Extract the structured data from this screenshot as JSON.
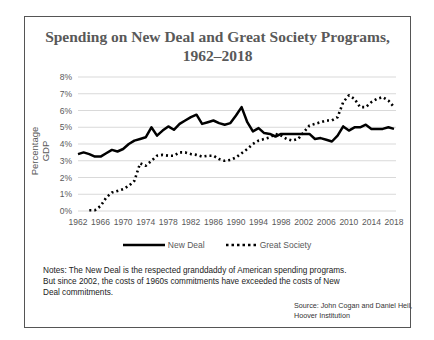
{
  "chart_data": {
    "type": "line",
    "title": "Spending on New Deal and Great Society Programs, 1962–2018",
    "title_line1": "Spending on New Deal and Great Society Programs,",
    "title_line2": "1962–2018",
    "xlabel": "",
    "ylabel": "Percentage GDP",
    "ylim": [
      0,
      8
    ],
    "y_ticks": [
      "0%",
      "1%",
      "2%",
      "3%",
      "4%",
      "5%",
      "6%",
      "7%",
      "8%"
    ],
    "x_ticks": [
      "1962",
      "1966",
      "1970",
      "1974",
      "1978",
      "1982",
      "1986",
      "1990",
      "1994",
      "1998",
      "2002",
      "2006",
      "2010",
      "2014",
      "2018"
    ],
    "grid": true,
    "legend_position": "bottom",
    "x": [
      1962,
      1963,
      1964,
      1965,
      1966,
      1967,
      1968,
      1969,
      1970,
      1971,
      1972,
      1973,
      1974,
      1975,
      1976,
      1977,
      1978,
      1979,
      1980,
      1981,
      1982,
      1983,
      1984,
      1985,
      1986,
      1987,
      1988,
      1989,
      1990,
      1991,
      1992,
      1993,
      1994,
      1995,
      1996,
      1997,
      1998,
      1999,
      2000,
      2001,
      2002,
      2003,
      2004,
      2005,
      2006,
      2007,
      2008,
      2009,
      2010,
      2011,
      2012,
      2013,
      2014,
      2015,
      2016,
      2017,
      2018
    ],
    "series": [
      {
        "name": "New Deal",
        "style": "solid",
        "color": "#000000",
        "values": [
          3.4,
          3.5,
          3.4,
          3.25,
          3.25,
          3.45,
          3.65,
          3.55,
          3.7,
          4.0,
          4.2,
          4.3,
          4.4,
          5.0,
          4.5,
          4.8,
          5.05,
          4.85,
          5.2,
          5.4,
          5.6,
          5.75,
          5.2,
          5.3,
          5.4,
          5.25,
          5.15,
          5.25,
          5.7,
          6.2,
          5.3,
          4.75,
          4.95,
          4.65,
          4.6,
          4.45,
          4.6,
          4.6,
          4.6,
          4.6,
          4.6,
          4.6,
          4.3,
          4.35,
          4.25,
          4.15,
          4.5,
          5.05,
          4.8,
          5.0,
          5.0,
          5.15,
          4.9,
          4.9,
          4.9,
          5.0,
          4.9
        ]
      },
      {
        "name": "Great Society",
        "style": "dotted",
        "color": "#000000",
        "values": [
          null,
          null,
          0.05,
          0.05,
          0.3,
          0.8,
          1.1,
          1.2,
          1.3,
          1.5,
          1.8,
          2.85,
          2.7,
          3.0,
          3.3,
          3.35,
          3.3,
          3.3,
          3.5,
          3.5,
          3.4,
          3.35,
          3.25,
          3.3,
          3.3,
          3.1,
          3.0,
          3.05,
          3.2,
          3.45,
          3.7,
          4.0,
          4.2,
          4.3,
          4.4,
          4.6,
          4.5,
          4.3,
          4.2,
          4.3,
          4.7,
          5.1,
          5.2,
          5.3,
          5.4,
          5.4,
          5.6,
          6.5,
          6.9,
          6.7,
          6.2,
          6.2,
          6.5,
          6.7,
          6.8,
          6.6,
          6.2
        ]
      }
    ]
  },
  "legend": {
    "items": [
      {
        "label": "New Deal"
      },
      {
        "label": "Great Society"
      }
    ]
  },
  "notes": {
    "text": "Notes: The New Deal is the respected granddaddy of American spending programs. But since 2002, the costs of 1960s commitments have exceeded the costs of New Deal commitments."
  },
  "source": {
    "line1": "Source: John Cogan and Daniel Heil,",
    "line2": "Hoover Institution"
  },
  "colors": {
    "frame": "#555555",
    "grid": "#d9d9d9",
    "axis_text": "#595959",
    "series": "#000000"
  }
}
